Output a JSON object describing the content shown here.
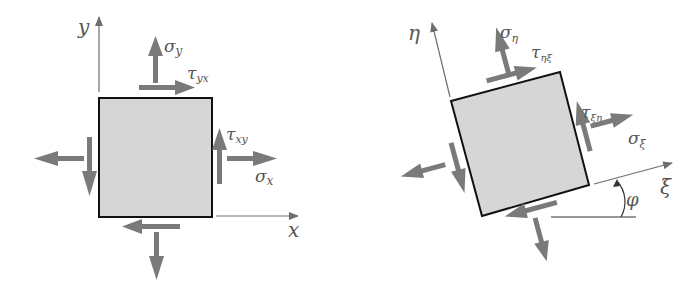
{
  "colors": {
    "element_fill": "#d6d6d6",
    "element_stroke": "#111111",
    "arrow": "#7a7a7a",
    "axis": "#6e6e6e",
    "label": "#555555"
  },
  "left_panel": {
    "axis_x_label": "x",
    "axis_y_label": "y",
    "sigma_x": {
      "sym": "σ",
      "sub": "x"
    },
    "sigma_y": {
      "sym": "σ",
      "sub": "y"
    },
    "tau_xy": {
      "sym": "τ",
      "sub": "xy"
    },
    "tau_yx": {
      "sym": "τ",
      "sub": "yx"
    }
  },
  "right_panel": {
    "axis_xi_label": "ξ",
    "axis_eta_label": "η",
    "angle_label": "φ",
    "sigma_xi": {
      "sym": "σ",
      "sub": "ξ"
    },
    "sigma_eta": {
      "sym": "σ",
      "sub": "η"
    },
    "tau_xi_eta": {
      "sym": "τ",
      "sub": "ξη"
    },
    "tau_eta_xi": {
      "sym": "τ",
      "sub": "ηξ"
    }
  }
}
